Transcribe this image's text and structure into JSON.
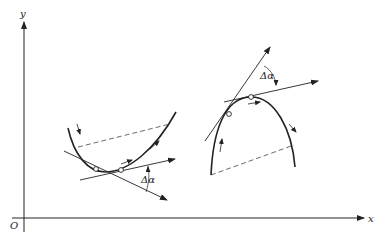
{
  "figure": {
    "axes": {
      "x_label": "x",
      "y_label": "y",
      "origin_label": "O"
    },
    "left_curve": {
      "shape": "convex (opening upward)",
      "angle_label": "Δα",
      "marked_points": 2
    },
    "right_curve": {
      "shape": "concave (opening downward)",
      "angle_label": "Δα",
      "marked_points": 2
    },
    "colors": {
      "stroke": "#222222",
      "background": "#ffffff"
    }
  }
}
